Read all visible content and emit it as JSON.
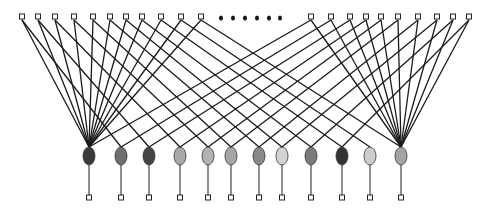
{
  "diagram": {
    "title": "",
    "top_left_nodes_x": [
      22,
      38,
      55,
      74,
      93,
      110,
      126,
      142,
      161,
      181,
      201
    ],
    "top_right_nodes_x": [
      311,
      331,
      350,
      366,
      381,
      398,
      418,
      437,
      453,
      469
    ],
    "top_y": 17,
    "ellipsis_dots_x": [
      221,
      233,
      245,
      257,
      269,
      280
    ],
    "ellipsis_y": 18,
    "ovals": [
      {
        "x": 89,
        "fill": "#3a3a3a"
      },
      {
        "x": 121,
        "fill": "#6e6e6e"
      },
      {
        "x": 149,
        "fill": "#444444"
      },
      {
        "x": 180,
        "fill": "#a8a8a8"
      },
      {
        "x": 208,
        "fill": "#b2b2b2"
      },
      {
        "x": 231,
        "fill": "#a6a6a6"
      },
      {
        "x": 259,
        "fill": "#888888"
      },
      {
        "x": 282,
        "fill": "#d2d2d2"
      },
      {
        "x": 311,
        "fill": "#7a7a7a"
      },
      {
        "x": 342,
        "fill": "#333333"
      },
      {
        "x": 370,
        "fill": "#cccccc"
      },
      {
        "x": 401,
        "fill": "#a4a4a4"
      }
    ],
    "oval_cy": 156,
    "oval_rx": 6,
    "oval_ry": 9,
    "bottom_y": 198,
    "left_hub_index": 0,
    "right_hub_index": 11
  }
}
